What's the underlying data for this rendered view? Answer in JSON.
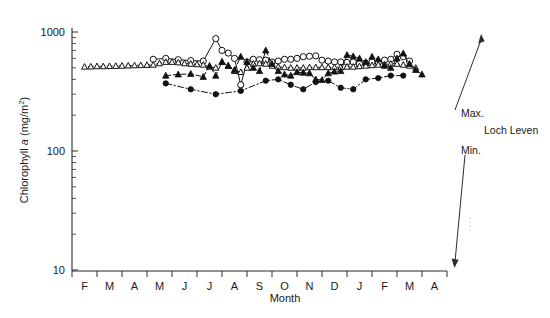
{
  "chart_data": {
    "type": "line",
    "title": "",
    "xlabel": "Month",
    "ylabel": "Chlorophyll a (mg/m2)",
    "ylabel_parts": {
      "prefix": "Chlorophyll ",
      "italic": "a",
      "suffix": " (mg/m",
      "superscript": "2",
      "tail": ")"
    },
    "yscale": "log",
    "ylim": [
      10,
      1000
    ],
    "ytick_labels": [
      "1000",
      "100",
      "10"
    ],
    "ytick_values": [
      1000,
      100,
      10
    ],
    "grid": false,
    "legend_position": "none",
    "xtick_labels": [
      "F",
      "M",
      "A",
      "M",
      "J",
      "J",
      "A",
      "S",
      "O",
      "N",
      "D",
      "J",
      "F",
      "M",
      "A"
    ],
    "x": [
      0,
      1,
      2,
      3,
      4,
      5,
      6,
      7,
      8,
      9,
      10,
      11,
      12,
      13,
      14,
      15,
      16,
      17,
      18,
      19,
      20,
      21,
      22,
      23,
      24,
      25,
      26,
      27,
      28,
      29,
      30,
      31,
      32,
      33,
      34,
      35,
      36,
      37,
      38,
      39,
      40,
      41,
      42,
      43,
      44,
      45,
      46,
      47,
      48,
      49,
      50,
      51,
      52,
      53,
      54,
      55,
      56
    ],
    "series": [
      {
        "name": "open-circle-solid",
        "marker": "open-circle",
        "linestyle": "solid",
        "x": [
          11,
          13,
          15,
          17,
          19,
          21,
          22,
          23,
          24,
          25,
          26,
          27,
          28,
          29,
          30,
          31,
          32,
          33,
          34,
          35,
          36,
          37,
          38,
          39,
          40,
          41,
          42,
          43,
          44,
          45,
          46,
          47,
          48,
          49,
          50,
          51,
          52
        ],
        "values": [
          590,
          600,
          585,
          575,
          570,
          880,
          700,
          665,
          600,
          360,
          560,
          590,
          585,
          580,
          560,
          570,
          590,
          590,
          600,
          620,
          625,
          630,
          580,
          570,
          560,
          560,
          555,
          560,
          540,
          545,
          560,
          555,
          580,
          590,
          650,
          620,
          570
        ]
      },
      {
        "name": "open-triangle-dotted",
        "marker": "open-triangle",
        "linestyle": "dotted",
        "x": [
          0,
          1,
          2,
          3,
          4,
          5,
          6,
          7,
          8,
          9,
          10,
          11,
          12,
          13,
          14,
          15,
          16,
          17,
          18,
          19,
          20,
          21,
          22,
          23,
          24,
          25,
          26,
          27,
          28,
          29,
          30,
          31,
          32,
          33,
          34,
          35,
          36,
          37,
          38,
          39,
          40,
          41,
          42,
          43,
          44,
          45,
          46,
          47,
          48,
          49,
          50,
          51,
          52,
          53
        ],
        "values": [
          510,
          512,
          515,
          514,
          516,
          518,
          520,
          522,
          524,
          526,
          528,
          530,
          545,
          560,
          560,
          555,
          545,
          540,
          535,
          530,
          510,
          500,
          560,
          520,
          470,
          460,
          500,
          540,
          545,
          540,
          520,
          510,
          505,
          500,
          500,
          500,
          505,
          505,
          505,
          505,
          505,
          505,
          510,
          510,
          515,
          520,
          525,
          530,
          535,
          540,
          540,
          530,
          520,
          500
        ]
      },
      {
        "name": "filled-triangle-dashed",
        "marker": "filled-triangle",
        "linestyle": "dashed",
        "x": [
          13,
          15,
          17,
          19,
          20,
          21,
          22,
          23,
          24,
          25,
          26,
          27,
          28,
          29,
          30,
          31,
          32,
          33,
          34,
          35,
          36,
          37,
          38,
          39,
          40,
          41,
          42,
          43,
          44,
          45,
          46,
          47,
          48,
          49,
          50,
          51,
          52,
          53,
          54
        ],
        "values": [
          430,
          440,
          445,
          420,
          520,
          430,
          560,
          520,
          480,
          620,
          560,
          500,
          470,
          700,
          540,
          470,
          440,
          430,
          460,
          455,
          450,
          400,
          395,
          450,
          465,
          470,
          640,
          625,
          600,
          560,
          620,
          590,
          520,
          500,
          600,
          660,
          540,
          480,
          440
        ]
      },
      {
        "name": "filled-circle-dashdot",
        "marker": "filled-circle",
        "linestyle": "dashdot",
        "x": [
          13,
          17,
          21,
          25,
          29,
          31,
          33,
          35,
          37,
          39,
          41,
          43,
          45,
          47,
          49,
          51
        ],
        "values": [
          370,
          330,
          300,
          320,
          390,
          400,
          360,
          330,
          380,
          390,
          340,
          330,
          400,
          410,
          430,
          430
        ]
      }
    ],
    "annotations": [
      {
        "name": "max-label",
        "text": "Max."
      },
      {
        "name": "site-label",
        "text": "Loch Leven"
      },
      {
        "name": "min-label",
        "text": "Min."
      }
    ]
  }
}
